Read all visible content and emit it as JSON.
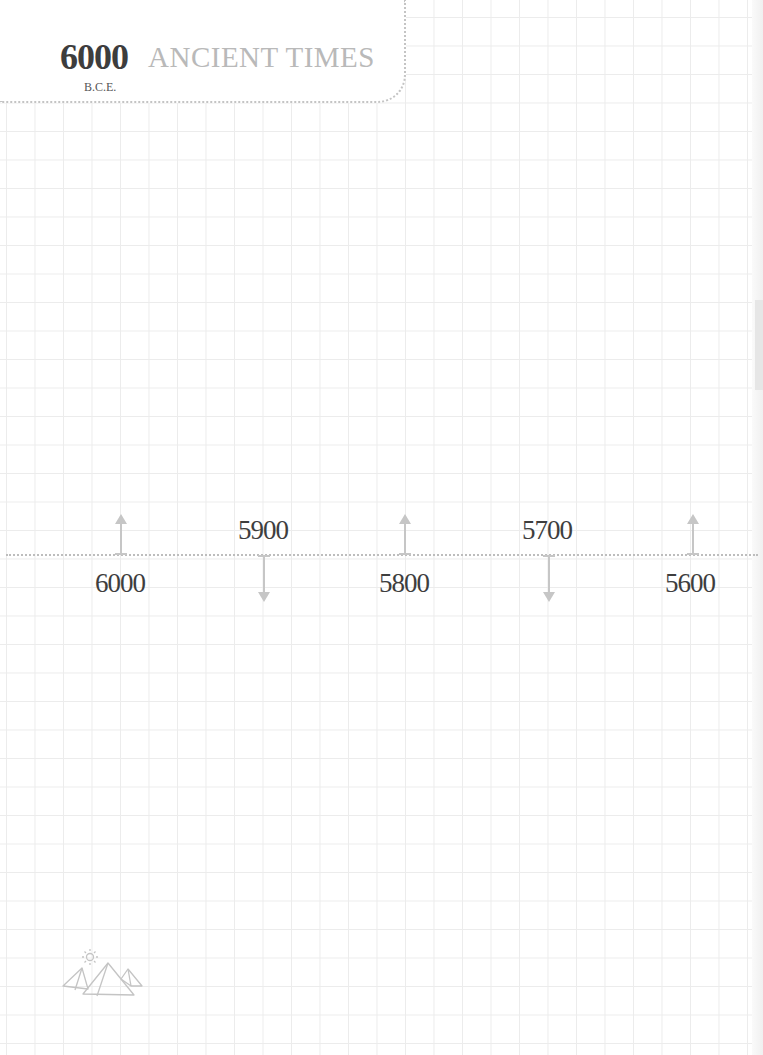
{
  "header": {
    "year": "6000",
    "era": "B.C.E.",
    "title": "ANCIENT TIMES"
  },
  "timeline": {
    "markers": [
      {
        "label": "6000",
        "direction": "up",
        "label_position": "below"
      },
      {
        "label": "5900",
        "direction": "down",
        "label_position": "above"
      },
      {
        "label": "5800",
        "direction": "up",
        "label_position": "below"
      },
      {
        "label": "5700",
        "direction": "down",
        "label_position": "above"
      },
      {
        "label": "5600",
        "direction": "up",
        "label_position": "below"
      }
    ]
  },
  "decoration": {
    "icon": "pyramids-with-sun-icon"
  },
  "colors": {
    "year_text": "#3d3d3d",
    "title_text": "#b9b9b9",
    "grid": "#ececec",
    "arrow": "#c6c6c6",
    "dotted_line": "#bdbdbd"
  }
}
